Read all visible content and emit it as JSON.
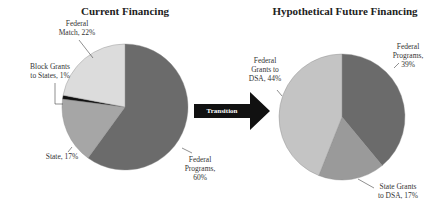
{
  "chart_data": [
    {
      "type": "pie",
      "title": "Current Financing",
      "slices": [
        {
          "label": "Federal Programs, 60%",
          "name": "Federal Programs",
          "value": 60,
          "color": "#6b6b6b"
        },
        {
          "label": "State, 17%",
          "name": "State",
          "value": 17,
          "color": "#a6a6a6"
        },
        {
          "label": "Block Grants to States, 1%",
          "name": "Block Grants to States",
          "value": 1,
          "color": "#111111"
        },
        {
          "label": "Federal Match, 22%",
          "name": "Federal Match",
          "value": 22,
          "color": "#dcdcdc"
        }
      ]
    },
    {
      "type": "pie",
      "title": "Hypothetical Future Financing",
      "slices": [
        {
          "label": "Federal Programs, 39%",
          "name": "Federal Programs",
          "value": 39,
          "color": "#6b6b6b"
        },
        {
          "label": "State Grants to DSA, 17%",
          "name": "State Grants to DSA",
          "value": 17,
          "color": "#9a9a9a"
        },
        {
          "label": "Federal Grants to DSA, 44%",
          "name": "Federal Grants to DSA",
          "value": 44,
          "color": "#c4c4c4"
        }
      ]
    }
  ],
  "left": {
    "title": "Current Financing",
    "labels": {
      "federal_match": [
        "Federal",
        "Match, 22%"
      ],
      "block_grants": [
        "Block Grants",
        "to States, 1%"
      ],
      "state": "State, 17%",
      "federal_programs": [
        "Federal",
        "Programs,",
        "60%"
      ]
    }
  },
  "right": {
    "title": "Hypothetical Future Financing",
    "labels": {
      "federal_grants": [
        "Federal",
        "Grants to",
        "DSA, 44%"
      ],
      "federal_programs": [
        "Federal",
        "Programs,",
        "39%"
      ],
      "state_grants": [
        "State Grants",
        "to DSA, 17%"
      ]
    }
  },
  "arrow": {
    "label": "Transition",
    "color": "#111111"
  }
}
